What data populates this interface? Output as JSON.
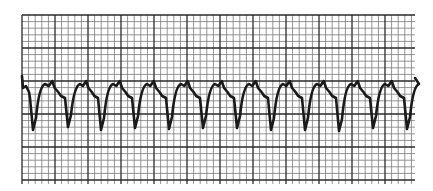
{
  "colors": {
    "paper": "#ffffff",
    "grid_minor": "#7a7a7a",
    "grid_major": "#2a2a2a",
    "trace": "#1a1a1a"
  },
  "grid": {
    "x0": 22,
    "y0": 15,
    "x1": 415,
    "y1": 184,
    "minor_px": 6.6,
    "major_every": 5
  },
  "trace": {
    "baseline_y": 90,
    "complex_x": [
      33,
      68,
      101,
      135,
      169,
      203,
      237,
      271,
      305,
      339,
      373,
      407
    ],
    "trough_y": [
      130,
      127,
      130,
      128,
      129,
      128,
      128,
      130,
      130,
      131,
      128,
      129
    ]
  }
}
